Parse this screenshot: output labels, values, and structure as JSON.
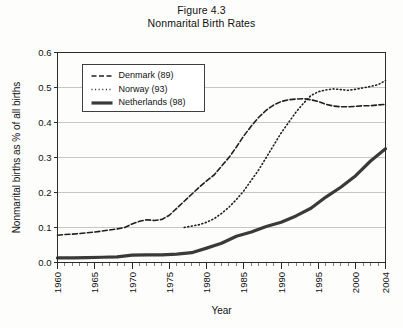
{
  "figure": {
    "title_line1": "Figure 4.3",
    "title_line2": "Nonmarital Birth Rates"
  },
  "chart_data": {
    "type": "line",
    "title": "Nonmarital Birth Rates",
    "subtitle": "Figure 4.3",
    "xlabel": "Year",
    "ylabel": "Nonmarital births as % of all births",
    "xlim": [
      1960,
      2004
    ],
    "ylim": [
      0.0,
      0.6
    ],
    "grid": true,
    "legend_position": "upper-left-inside",
    "y_ticks": [
      0.0,
      0.1,
      0.2,
      0.3,
      0.4,
      0.5,
      0.6
    ],
    "y_tick_labels": [
      "0.0",
      "0.1",
      "0.2",
      "0.3",
      "0.4",
      "0.5",
      "0.6"
    ],
    "x_ticks": [
      1960,
      1965,
      1970,
      1975,
      1980,
      1985,
      1990,
      1995,
      2000,
      2004
    ],
    "x_tick_labels": [
      "1960",
      "1965",
      "1970",
      "1975",
      "1980",
      "1985",
      "1990",
      "1995",
      "2000",
      "2004"
    ],
    "x_minor_tick_step": 1,
    "series": [
      {
        "name": "Denmark (89)",
        "legend_label": "Denmark (89)",
        "style": "dashed",
        "color": "#1f1f1f",
        "width": 1.6,
        "dash": "5,2.5",
        "x": [
          1960,
          1961,
          1962,
          1963,
          1964,
          1965,
          1966,
          1967,
          1968,
          1969,
          1970,
          1971,
          1972,
          1973,
          1974,
          1975,
          1976,
          1977,
          1978,
          1979,
          1980,
          1981,
          1982,
          1983,
          1984,
          1985,
          1986,
          1987,
          1988,
          1989,
          1990,
          1991,
          1992,
          1993,
          1994,
          1995,
          1996,
          1997,
          1998,
          1999,
          2000,
          2001,
          2002,
          2003,
          2004
        ],
        "y": [
          0.078,
          0.08,
          0.081,
          0.083,
          0.085,
          0.087,
          0.09,
          0.093,
          0.096,
          0.1,
          0.11,
          0.118,
          0.122,
          0.12,
          0.123,
          0.135,
          0.155,
          0.175,
          0.195,
          0.215,
          0.233,
          0.25,
          0.275,
          0.3,
          0.33,
          0.362,
          0.39,
          0.415,
          0.435,
          0.45,
          0.46,
          0.465,
          0.467,
          0.468,
          0.465,
          0.46,
          0.452,
          0.447,
          0.445,
          0.445,
          0.446,
          0.448,
          0.448,
          0.45,
          0.452
        ]
      },
      {
        "name": "Norway (93)",
        "legend_label": "Norway (93)",
        "style": "dotted",
        "color": "#1f1f1f",
        "width": 1.6,
        "dash": "1,2.6",
        "x": [
          1977,
          1978,
          1979,
          1980,
          1981,
          1982,
          1983,
          1984,
          1985,
          1986,
          1987,
          1988,
          1989,
          1990,
          1991,
          1992,
          1993,
          1994,
          1995,
          1996,
          1997,
          1998,
          1999,
          2000,
          2001,
          2002,
          2003,
          2004
        ],
        "y": [
          0.1,
          0.104,
          0.108,
          0.115,
          0.125,
          0.14,
          0.158,
          0.18,
          0.205,
          0.235,
          0.265,
          0.3,
          0.335,
          0.37,
          0.4,
          0.43,
          0.455,
          0.477,
          0.488,
          0.493,
          0.496,
          0.494,
          0.492,
          0.495,
          0.499,
          0.503,
          0.508,
          0.52
        ]
      },
      {
        "name": "Netherlands (98)",
        "legend_label": "Netherlands (98)",
        "style": "solid",
        "color": "#3a3a3a",
        "width": 3.2,
        "dash": "none",
        "x": [
          1960,
          1962,
          1964,
          1966,
          1968,
          1970,
          1972,
          1974,
          1976,
          1978,
          1980,
          1982,
          1984,
          1986,
          1988,
          1990,
          1992,
          1994,
          1996,
          1998,
          2000,
          2002,
          2004
        ],
        "y": [
          0.013,
          0.013,
          0.014,
          0.015,
          0.016,
          0.021,
          0.022,
          0.022,
          0.024,
          0.028,
          0.041,
          0.055,
          0.075,
          0.087,
          0.103,
          0.115,
          0.133,
          0.155,
          0.187,
          0.215,
          0.248,
          0.29,
          0.325
        ]
      }
    ]
  }
}
